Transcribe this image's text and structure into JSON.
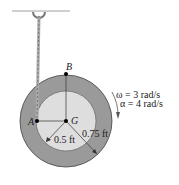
{
  "diagram": {
    "point_labels": {
      "A": "A",
      "B": "B",
      "G": "G"
    },
    "dimensions": {
      "inner_radius": "0.5 ft",
      "outer_radius": "0.75 ft"
    },
    "kinematics": {
      "omega": "ω = 3 rad/s",
      "alpha": "α = 4 rad/s"
    },
    "colors": {
      "outer_ring": "#9a9a9a",
      "inner_disk": "#dedede",
      "rope": "#aaaaaa"
    }
  }
}
